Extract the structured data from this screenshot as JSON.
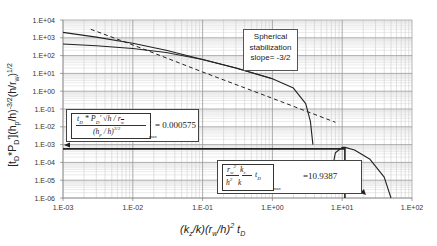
{
  "chart_data": {
    "type": "line",
    "title": "",
    "xlabel": "(k_z/k)(r_w/h)^2 t_D",
    "ylabel": "[t_D*P_D'](h_p/h)^-3/2 (h/r_w)^1/2",
    "x_scale": "log",
    "y_scale": "log",
    "xlim": [
      0.001,
      100
    ],
    "ylim": [
      1e-06,
      10000
    ],
    "grid": true,
    "legend": "none",
    "x_ticks": [
      "1.E-03",
      "1.E-02",
      "1.E-01",
      "1.E+00",
      "1.E+01",
      "1.E+02"
    ],
    "y_ticks": [
      "1.E+04",
      "1.E+03",
      "1.E+02",
      "1.E+01",
      "1.E+00",
      "1.E-01",
      "1.E-02",
      "1.E-03",
      "1.E-04",
      "1.E-05",
      "1.E-06"
    ],
    "series": [
      {
        "name": "upper derivative curve",
        "style": "solid",
        "x": [
          0.001,
          0.003,
          0.01,
          0.03,
          0.1,
          0.3,
          1.0,
          2.0,
          3.0,
          3.5,
          3.8
        ],
        "y": [
          2000,
          1100,
          500,
          200,
          60,
          20,
          5,
          1.5,
          0.2,
          0.02,
          0.001
        ]
      },
      {
        "name": "lower derivative curve",
        "style": "solid",
        "x": [
          0.001,
          0.003,
          0.01,
          0.03,
          0.1,
          0.3,
          1.0
        ],
        "y": [
          450,
          360,
          250,
          150,
          60,
          20,
          5
        ]
      },
      {
        "name": "spherical stabilization slope -3/2",
        "style": "dashed",
        "x": [
          0.0025,
          0.01,
          0.1,
          1.0,
          8.0
        ],
        "y": [
          3000,
          400,
          12,
          0.4,
          0.018
        ]
      },
      {
        "name": "late-time curve",
        "style": "solid",
        "x": [
          7.0,
          8.0,
          10.0,
          11.0,
          15.0,
          25.0,
          40.0,
          50.0
        ],
        "y": [
          2.5e-05,
          0.00035,
          0.0007,
          0.0007,
          0.0005,
          0.00015,
          1.5e-05,
          1e-06
        ]
      },
      {
        "name": "horizontal reference line",
        "style": "solid-thick",
        "x": [
          0.001,
          11.0
        ],
        "y": [
          0.000575,
          0.000575
        ]
      },
      {
        "name": "vertical reference line",
        "style": "solid-thick",
        "x": [
          10.9387,
          10.9387
        ],
        "y": [
          0.0007,
          1e-06
        ]
      }
    ],
    "annotations": [
      {
        "text": "Spherical stabilization slope= -3/2"
      },
      {
        "text": "[t_D * P_D' sqrt(h/r_w) / (h_p/h)^3/2]_max = 0.000575",
        "value": "0.000575"
      },
      {
        "text": "[(r_w^2/h^2)(k_z/k) t_D]_max = 10.9387",
        "value": "10.9387"
      }
    ]
  },
  "labels": {
    "ylabel_html": "[t_D*P_D'](h_p/h)^-3/2(h/r_w)^1/2",
    "xlabel": "(k",
    "note_line1": "Spherical",
    "note_line2": "stabilization",
    "note_line3": "slope= -3/2",
    "formula1_num": "t_D * P_D' √(h / r_w)",
    "formula1_den": "(h_p / h)^3/2",
    "formula1_sub": "max",
    "formula1_value": "= 0.000575",
    "formula2_num": "r_w² k_z",
    "formula2_den": "h²  k",
    "formula2_tail": "t_D",
    "formula2_sub": "max",
    "formula2_value": "=10.9387"
  }
}
